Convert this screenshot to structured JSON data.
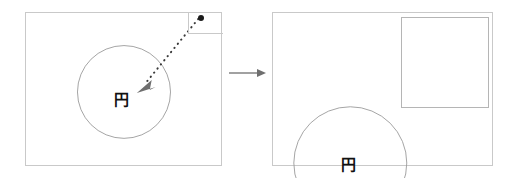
{
  "figure": {
    "type": "before-after-diagram",
    "transition_icon": "right-arrow-icon",
    "stroke_color": "#c9c9c9",
    "accent_color": "#777777",
    "text_color": "#111111",
    "background_color": "#ffffff"
  },
  "left_panel": {
    "name": "before-state",
    "circle": {
      "label": "円",
      "shape": "circle-outline"
    },
    "corner_rect": {
      "name": "collapsed-square-region"
    },
    "cursor": {
      "name": "cursor-dot"
    },
    "drag_arrow": {
      "name": "dotted-drag-arrow",
      "style": "dotted",
      "direction": "down-left"
    }
  },
  "transition": {
    "label": "",
    "icon": "arrow-right-icon"
  },
  "right_panel": {
    "name": "after-state",
    "circle": {
      "label": "円",
      "shape": "circle-outline-clipped"
    },
    "square": {
      "label": "正方形",
      "shape": "square-outline"
    },
    "point": {
      "name": "square-anchor-dot"
    }
  }
}
